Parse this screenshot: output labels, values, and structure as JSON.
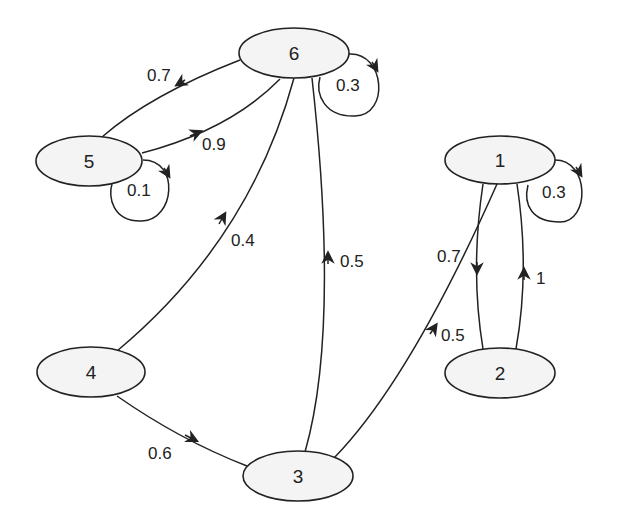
{
  "diagram": {
    "type": "directed-weighted-graph",
    "nodes": [
      {
        "id": "1",
        "label": "1"
      },
      {
        "id": "2",
        "label": "2"
      },
      {
        "id": "3",
        "label": "3"
      },
      {
        "id": "4",
        "label": "4"
      },
      {
        "id": "5",
        "label": "5"
      },
      {
        "id": "6",
        "label": "6"
      }
    ],
    "edges": [
      {
        "from": "6",
        "to": "5",
        "weight": "0.7"
      },
      {
        "from": "5",
        "to": "6",
        "weight": "0.9"
      },
      {
        "from": "5",
        "to": "5",
        "weight": "0.1"
      },
      {
        "from": "6",
        "to": "6",
        "weight": "0.3"
      },
      {
        "from": "4",
        "to": "6",
        "weight": "0.4"
      },
      {
        "from": "3",
        "to": "6",
        "weight": "0.5"
      },
      {
        "from": "4",
        "to": "3",
        "weight": "0.6"
      },
      {
        "from": "3",
        "to": "1",
        "weight": "0.5"
      },
      {
        "from": "1",
        "to": "2",
        "weight": "0.7"
      },
      {
        "from": "2",
        "to": "1",
        "weight": "1"
      },
      {
        "from": "1",
        "to": "1",
        "weight": "0.3"
      }
    ]
  }
}
